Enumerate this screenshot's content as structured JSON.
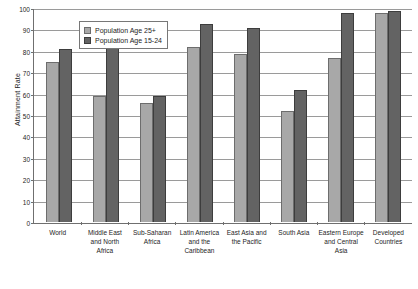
{
  "chart_data": {
    "type": "bar",
    "title": "",
    "xlabel": "",
    "ylabel": "Attainment Rate",
    "ylim": [
      0,
      100
    ],
    "yticks": [
      0,
      10,
      20,
      30,
      40,
      50,
      60,
      70,
      80,
      90,
      100
    ],
    "grid": true,
    "legend_position": "top-left-inside",
    "categories": [
      "World",
      "Middle East and North Africa",
      "Sub-Saharan Africa",
      "Latin America and the Caribbean",
      "East Asia and the Pacific",
      "South Asia",
      "Eastern Europe and Central Asia",
      "Developed Countries"
    ],
    "series": [
      {
        "name": "Population Age 25+",
        "color": "#a8a8a8",
        "values": [
          75,
          59,
          56,
          82,
          79,
          52,
          77,
          98
        ]
      },
      {
        "name": "Population Age 15-24",
        "color": "#636363",
        "values": [
          81,
          93,
          59,
          93,
          91,
          62,
          98,
          99
        ]
      }
    ]
  }
}
